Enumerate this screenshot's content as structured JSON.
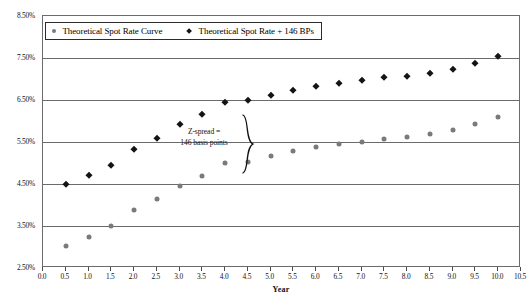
{
  "chart_data": {
    "type": "scatter",
    "title": "",
    "xlabel": "Year",
    "ylabel": "",
    "xlim": [
      0.0,
      10.5
    ],
    "ylim": [
      2.5,
      8.5
    ],
    "grid": true,
    "legend_position": "top-left",
    "x_ticks": [
      "0.0",
      "0.5",
      "1.0",
      "1.5",
      "2.0",
      "2.5",
      "3.0",
      "3.5",
      "4.0",
      "4.5",
      "5.0",
      "5.5",
      "6.0",
      "6.5",
      "7.0",
      "7.5",
      "8.0",
      "8.5",
      "9.0",
      "9.5",
      "10.0",
      "10.5"
    ],
    "x_tick_values": [
      0.0,
      0.5,
      1.0,
      1.5,
      2.0,
      2.5,
      3.0,
      3.5,
      4.0,
      4.5,
      5.0,
      5.5,
      6.0,
      6.5,
      7.0,
      7.5,
      8.0,
      8.5,
      9.0,
      9.5,
      10.0,
      10.5
    ],
    "y_ticks": [
      "2.50%",
      "3.50%",
      "4.50%",
      "5.50%",
      "6.50%",
      "7.50%",
      "8.50%"
    ],
    "y_tick_values": [
      2.5,
      3.5,
      4.5,
      5.5,
      6.5,
      7.5,
      8.5
    ],
    "x": [
      0.5,
      1.0,
      1.5,
      2.0,
      2.5,
      3.0,
      3.5,
      4.0,
      4.5,
      5.0,
      5.5,
      6.0,
      6.5,
      7.0,
      7.5,
      8.0,
      8.5,
      9.0,
      9.5,
      10.0
    ],
    "series": [
      {
        "name": "Theoretical Spot Rate Curve",
        "marker": "circle",
        "color": "#7a7a7a",
        "values": [
          3.03,
          3.25,
          3.5,
          3.87,
          4.14,
          4.46,
          4.7,
          5.0,
          5.03,
          5.17,
          5.28,
          5.37,
          5.45,
          5.51,
          5.58,
          5.62,
          5.69,
          5.78,
          5.93,
          6.09
        ]
      },
      {
        "name": "Theoretical Spot Rate + 146 BPs",
        "marker": "diamond",
        "color": "#141414",
        "values": [
          4.49,
          4.71,
          4.96,
          5.33,
          5.6,
          5.92,
          6.16,
          6.46,
          6.49,
          6.63,
          6.74,
          6.83,
          6.91,
          6.97,
          7.04,
          7.08,
          7.15,
          7.24,
          7.39,
          7.55
        ]
      }
    ],
    "annotations": [
      {
        "name": "z-spread-note",
        "line1": "Z-spread =",
        "line2": "146 basis points"
      }
    ]
  },
  "legend": {
    "items": [
      {
        "label": "Theoretical Spot Rate Curve",
        "marker": "circle"
      },
      {
        "label": "Theoretical Spot Rate + 146 BPs",
        "marker": "diamond"
      }
    ]
  },
  "axis": {
    "x_title": "Year"
  }
}
